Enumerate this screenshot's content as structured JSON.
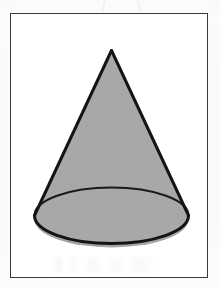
{
  "figure": {
    "kind": "geometric-solid",
    "shape_name": "cone",
    "caption": "",
    "frame": {
      "x": 10,
      "y": 13,
      "width": 198,
      "height": 265,
      "border_color": "#3a3a3e",
      "border_width": 1.5,
      "background_color": "#ffffff"
    },
    "geometry": {
      "apex": {
        "x": 112,
        "y": 51
      },
      "base_ellipse": {
        "center_x": 112,
        "center_y": 220,
        "radius_x": 77,
        "radius_y": 28
      },
      "left_base_point": {
        "x": 35,
        "y": 216
      },
      "right_base_point": {
        "x": 189,
        "y": 216
      },
      "front_arc_visible": true,
      "back_arc_visible": true
    },
    "style": {
      "fill_color": "#a8a8a8",
      "fill_color_base": "#a4a4a4",
      "outline_color": "#141414",
      "outline_width": 3,
      "back_arc_color": "#1a1a1a",
      "back_arc_width": 2,
      "page_background": "#fdfdfd"
    },
    "labels": [],
    "annotations": []
  },
  "icons": {
    "cone_icon": "cone-solid-icon"
  }
}
